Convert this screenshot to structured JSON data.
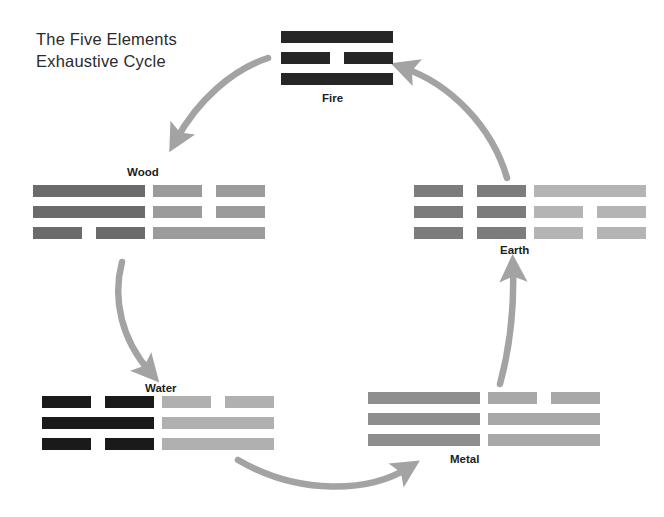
{
  "title": "The Five Elements\nExhaustive Cycle",
  "colors": {
    "background": "#ffffff",
    "text": "#2b2b2b",
    "label": "#1d1d1d",
    "arrow": "#a3a3a3",
    "black": "#262626",
    "dark_gray": "#6b6b6b",
    "mid_gray": "#8e8e8e",
    "light_gray": "#a8a8a8",
    "pale_gray": "#b4b4b4"
  },
  "diagram": {
    "type": "cycle",
    "name": "five-elements-exhaustive-cycle",
    "nodes": [
      {
        "id": "fire",
        "label": "Fire",
        "label_x": 322,
        "label_y": 92,
        "x": 281,
        "y": 31,
        "trigrams": [
          {
            "color": "#262626",
            "width": 112,
            "lines": [
              "solid",
              "broken",
              "solid"
            ]
          }
        ]
      },
      {
        "id": "wood",
        "label": "Wood",
        "label_x": 127,
        "label_y": 166,
        "x": 33,
        "y": 185,
        "trigrams": [
          {
            "color": "#6b6b6b",
            "width": 112,
            "lines": [
              "solid",
              "solid",
              "broken"
            ]
          },
          {
            "color": "#9b9b9b",
            "width": 112,
            "lines": [
              "broken",
              "broken",
              "solid"
            ]
          }
        ]
      },
      {
        "id": "earth",
        "label": "Earth",
        "label_x": 500,
        "label_y": 244,
        "x": 414,
        "y": 185,
        "trigrams": [
          {
            "color": "#7c7c7c",
            "width": 112,
            "lines": [
              "broken",
              "broken",
              "broken"
            ]
          },
          {
            "color": "#b4b4b4",
            "width": 112,
            "lines": [
              "solid",
              "broken",
              "broken"
            ]
          }
        ]
      },
      {
        "id": "water",
        "label": "Water",
        "label_x": 145,
        "label_y": 382,
        "x": 42,
        "y": 396,
        "trigrams": [
          {
            "color": "#1a1a1a",
            "width": 112,
            "lines": [
              "broken",
              "solid",
              "broken"
            ]
          },
          {
            "color": "#b0b0b0",
            "width": 112,
            "lines": [
              "broken",
              "solid",
              "solid"
            ]
          }
        ]
      },
      {
        "id": "metal",
        "label": "Metal",
        "label_x": 450,
        "label_y": 453,
        "x": 368,
        "y": 392,
        "trigrams": [
          {
            "color": "#8e8e8e",
            "width": 112,
            "lines": [
              "solid",
              "solid",
              "solid"
            ]
          },
          {
            "color": "#a8a8a8",
            "width": 112,
            "lines": [
              "broken",
              "solid",
              "solid"
            ]
          }
        ]
      }
    ],
    "arrows": [
      {
        "id": "fire-to-wood",
        "from": "fire",
        "to": "wood"
      },
      {
        "id": "wood-to-water",
        "from": "wood",
        "to": "water"
      },
      {
        "id": "water-to-metal",
        "from": "water",
        "to": "metal"
      },
      {
        "id": "metal-to-earth",
        "from": "metal",
        "to": "earth"
      },
      {
        "id": "earth-to-fire",
        "from": "earth",
        "to": "fire"
      }
    ]
  }
}
